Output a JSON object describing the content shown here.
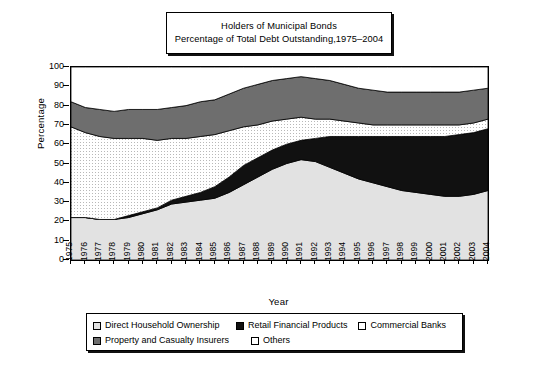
{
  "title": {
    "line1": "Holders of Municipal Bonds",
    "line2": "Percentage of Total Debt Outstanding,1975–2004"
  },
  "axes": {
    "ylabel": "Percentage",
    "xlabel": "Year",
    "yticks": [
      0,
      10,
      20,
      30,
      40,
      50,
      60,
      70,
      80,
      90,
      100
    ],
    "ylim": [
      0,
      100
    ]
  },
  "legend": {
    "items": [
      {
        "label": "Direct Household Ownership",
        "color": "#e2e2e2",
        "swatch": "light-gray"
      },
      {
        "label": "Retail Financial Products",
        "color": "#111111",
        "swatch": "black"
      },
      {
        "label": "Commercial Banks",
        "color": "#ffffff",
        "swatch": "white"
      },
      {
        "label": "Property and Casualty Insurers",
        "color": "#6e6e6e",
        "swatch": "dark-gray"
      },
      {
        "label": "Others",
        "color": "#ffffff",
        "swatch": "white"
      }
    ]
  },
  "chart_data": {
    "type": "area",
    "xlabel": "Year",
    "ylabel": "Percentage",
    "ylim": [
      0,
      100
    ],
    "grid": false,
    "legend_position": "bottom",
    "stacked": true,
    "categories": [
      "1975",
      "1976",
      "1977",
      "1978",
      "1979",
      "1980",
      "1981",
      "1982",
      "1983",
      "1984",
      "1985",
      "1986",
      "1987",
      "1988",
      "1989",
      "1990",
      "1991",
      "1992",
      "1993",
      "1994",
      "1995",
      "1996",
      "1997",
      "1998",
      "1999",
      "2000",
      "2001",
      "2002",
      "2003",
      "2004"
    ],
    "series": [
      {
        "name": "Direct Household Ownership",
        "color": "#e2e2e2",
        "values": [
          22,
          22,
          21,
          21,
          22,
          24,
          26,
          29,
          30,
          31,
          32,
          35,
          39,
          43,
          47,
          50,
          52,
          51,
          48,
          45,
          42,
          40,
          38,
          36,
          35,
          34,
          33,
          33,
          34,
          36
        ]
      },
      {
        "name": "Retail Financial Products",
        "color": "#111111",
        "values": [
          0,
          0,
          0,
          0,
          1,
          1,
          1,
          2,
          3,
          4,
          6,
          8,
          10,
          10,
          10,
          10,
          10,
          12,
          16,
          19,
          22,
          24,
          26,
          28,
          29,
          30,
          31,
          32,
          32,
          32
        ]
      },
      {
        "name": "Commercial Banks",
        "color": "#ffffff",
        "values": [
          47,
          44,
          43,
          42,
          40,
          38,
          35,
          32,
          30,
          29,
          27,
          24,
          20,
          17,
          15,
          13,
          12,
          10,
          9,
          8,
          7,
          6,
          6,
          6,
          6,
          6,
          6,
          5,
          5,
          5
        ]
      },
      {
        "name": "Property and Casualty Insurers",
        "color": "#6e6e6e",
        "values": [
          13,
          13,
          14,
          14,
          15,
          15,
          16,
          16,
          17,
          18,
          18,
          19,
          20,
          21,
          21,
          21,
          21,
          21,
          20,
          19,
          18,
          18,
          17,
          17,
          17,
          17,
          17,
          17,
          17,
          16
        ]
      },
      {
        "name": "Others",
        "color": "#ffffff",
        "values": [
          18,
          21,
          22,
          23,
          22,
          22,
          22,
          21,
          20,
          18,
          17,
          14,
          11,
          9,
          7,
          6,
          5,
          6,
          7,
          9,
          11,
          12,
          13,
          13,
          13,
          13,
          13,
          13,
          12,
          11
        ]
      }
    ],
    "cumulative_tops": {
      "note": "running totals used to draw the stacked bands",
      "direct_household": [
        22,
        22,
        21,
        21,
        22,
        24,
        26,
        29,
        30,
        31,
        32,
        35,
        39,
        43,
        47,
        50,
        52,
        51,
        48,
        45,
        42,
        40,
        38,
        36,
        35,
        34,
        33,
        33,
        34,
        36
      ],
      "plus_retail": [
        22,
        22,
        21,
        21,
        23,
        25,
        27,
        31,
        33,
        35,
        38,
        43,
        49,
        53,
        57,
        60,
        62,
        63,
        64,
        64,
        64,
        64,
        64,
        64,
        64,
        64,
        64,
        65,
        66,
        68
      ],
      "plus_commercial": [
        69,
        66,
        64,
        63,
        63,
        63,
        62,
        63,
        63,
        64,
        65,
        67,
        69,
        70,
        72,
        73,
        74,
        73,
        73,
        72,
        71,
        70,
        70,
        70,
        70,
        70,
        70,
        70,
        71,
        73
      ],
      "plus_property": [
        82,
        79,
        78,
        77,
        78,
        78,
        78,
        79,
        80,
        82,
        83,
        86,
        89,
        91,
        93,
        94,
        95,
        94,
        93,
        91,
        89,
        88,
        87,
        87,
        87,
        87,
        87,
        87,
        88,
        89
      ],
      "plus_others": [
        100,
        100,
        100,
        100,
        100,
        100,
        100,
        100,
        100,
        100,
        100,
        100,
        100,
        100,
        100,
        100,
        100,
        100,
        100,
        100,
        100,
        100,
        100,
        100,
        100,
        100,
        100,
        100,
        100,
        100
      ]
    }
  }
}
